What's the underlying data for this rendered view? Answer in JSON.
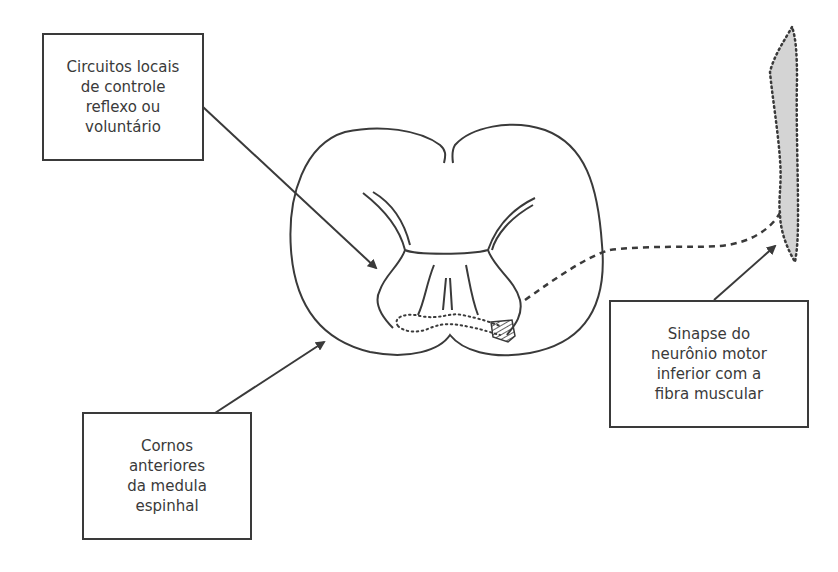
{
  "diagram": {
    "type": "anatomical-diagram",
    "labels": {
      "circuitos": {
        "text": "Circuitos locais\nde controle\nreflexo ou\nvoluntário"
      },
      "cornos": {
        "text": "Cornos\nanteriores\nda medula\nespinhal"
      },
      "sinapse": {
        "text": "Sinapse do\nneurônio motor\ninferior com a\nfibra muscular"
      }
    },
    "colors": {
      "stroke": "#3a3a3a",
      "muscle_fill": "#d4d4d4",
      "background": "#ffffff"
    }
  }
}
